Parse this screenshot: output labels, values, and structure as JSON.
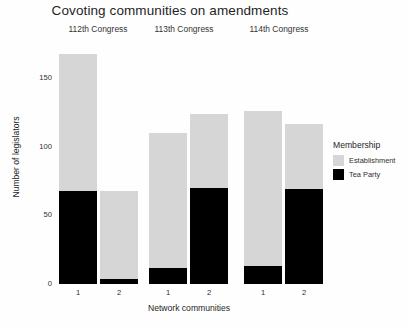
{
  "chart_data": {
    "type": "bar",
    "title": "Covoting communities on amendments",
    "xlabel": "Network communities",
    "ylabel": "Number of legislators",
    "ylim": [
      0,
      175
    ],
    "yticks": [
      0,
      50,
      100,
      150
    ],
    "ytick_labels": [
      "0",
      "50",
      "100",
      "150"
    ],
    "grid": false,
    "stacked": true,
    "legend": {
      "title": "Membership",
      "position": "right",
      "entries": [
        {
          "name": "Establishment",
          "color": "#d6d6d6"
        },
        {
          "name": "Tea Party",
          "color": "#000000"
        }
      ]
    },
    "facets": [
      {
        "label": "112th Congress",
        "categories": [
          "1",
          "2"
        ],
        "series": [
          {
            "name": "Tea Party",
            "values": [
              68,
              4
            ]
          },
          {
            "name": "Establishment",
            "values": [
              100,
              64
            ]
          }
        ],
        "totals": [
          168,
          68
        ]
      },
      {
        "label": "113th Congress",
        "categories": [
          "1",
          "2"
        ],
        "series": [
          {
            "name": "Tea Party",
            "values": [
              12,
              70
            ]
          },
          {
            "name": "Establishment",
            "values": [
              98,
              54
            ]
          }
        ],
        "totals": [
          110,
          124
        ]
      },
      {
        "label": "114th Congress",
        "categories": [
          "1",
          "2"
        ],
        "series": [
          {
            "name": "Tea Party",
            "values": [
              13,
              69
            ]
          },
          {
            "name": "Establishment",
            "values": [
              113,
              48
            ]
          }
        ],
        "totals": [
          126,
          117
        ]
      }
    ]
  }
}
